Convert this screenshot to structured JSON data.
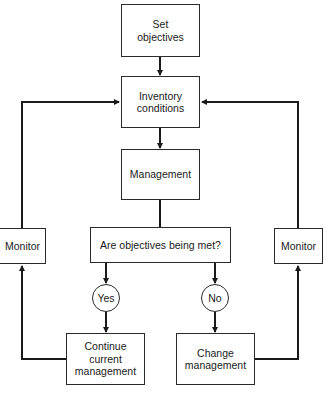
{
  "diagram": {
    "nodes": {
      "set_objectives": "Set\nobjectives",
      "inventory_conditions": "Inventory\nconditions",
      "management": "Management",
      "question": "Are objectives being met?",
      "monitor_left": "Monitor",
      "monitor_right": "Monitor",
      "yes": "Yes",
      "no": "No",
      "continue_management": "Continue\ncurrent\nmanagement",
      "change_management": "Change\nmanagement"
    },
    "edges": [
      {
        "from": "set_objectives",
        "to": "inventory_conditions"
      },
      {
        "from": "inventory_conditions",
        "to": "management"
      },
      {
        "from": "management",
        "to": "question"
      },
      {
        "from": "question",
        "to": "yes"
      },
      {
        "from": "question",
        "to": "no"
      },
      {
        "from": "yes",
        "to": "continue_management"
      },
      {
        "from": "no",
        "to": "change_management"
      },
      {
        "from": "continue_management",
        "to": "monitor_left"
      },
      {
        "from": "change_management",
        "to": "monitor_right"
      },
      {
        "from": "monitor_left",
        "to": "inventory_conditions"
      },
      {
        "from": "monitor_right",
        "to": "inventory_conditions"
      }
    ],
    "colors": {
      "line": "#1a1a1a",
      "background": "#ffffff"
    }
  }
}
